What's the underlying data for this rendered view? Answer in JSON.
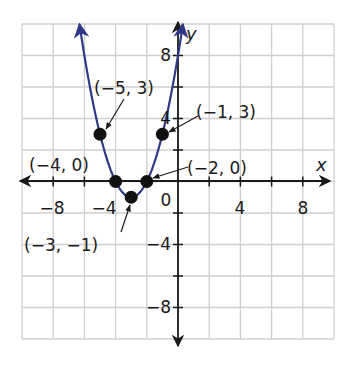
{
  "chart_data": {
    "type": "line",
    "title": "",
    "function": "y = (x + 3)^2 - 1",
    "xlabel": "x",
    "ylabel": "y",
    "xlim": [
      -10,
      10
    ],
    "ylim": [
      -10,
      10
    ],
    "grid": true,
    "grid_step": 2,
    "x_ticks": [
      -8,
      -4,
      0,
      4,
      8
    ],
    "y_ticks": [
      8,
      4,
      -4,
      -8
    ],
    "x_tick_labels": [
      "−8",
      "−4",
      "0",
      "4",
      "8"
    ],
    "y_tick_labels": [
      "8",
      "4",
      "−4",
      "−8"
    ],
    "origin_label": "0",
    "points": [
      {
        "x": -5,
        "y": 3,
        "label": "(−5, 3)"
      },
      {
        "x": -4,
        "y": 0,
        "label": "(−4, 0)"
      },
      {
        "x": -3,
        "y": -1,
        "label": "(−3, −1)"
      },
      {
        "x": -2,
        "y": 0,
        "label": "(−2, 0)"
      },
      {
        "x": -1,
        "y": 3,
        "label": "(−1, 3)"
      }
    ],
    "colors": {
      "curve": "#2e3a87",
      "grid": "#cfcfcf",
      "axis": "#1a1a1a",
      "point": "#111111"
    }
  },
  "labels": {
    "x_axis": "x",
    "y_axis": "y",
    "tick_x_neg8": "−8",
    "tick_x_neg4": "−4",
    "tick_origin": "0",
    "tick_x_4": "4",
    "tick_x_8": "8",
    "tick_y_8": "8",
    "tick_y_4": "4",
    "tick_y_neg4": "−4",
    "tick_y_neg8": "−8",
    "pt_neg5_3": "(−5, 3)",
    "pt_neg4_0": "(−4, 0)",
    "pt_neg3_neg1": "(−3, −1)",
    "pt_neg2_0": "(−2, 0)",
    "pt_neg1_3": "(−1, 3)"
  }
}
